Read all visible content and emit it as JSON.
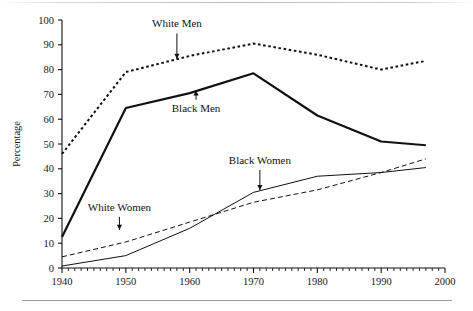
{
  "figure": {
    "background_color": "#ffffff",
    "axis_color": "#111114",
    "rule_color": "#9a9a9a"
  },
  "axes": {
    "ylabel": "Percentage",
    "xlabel": "",
    "y_ticks": [
      "0",
      "10",
      "20",
      "30",
      "40",
      "50",
      "60",
      "70",
      "80",
      "90",
      "100"
    ],
    "x_ticks": [
      "1940",
      "1950",
      "1960",
      "1970",
      "1980",
      "1990",
      "2000"
    ]
  },
  "annotations": [
    {
      "name": "white-men",
      "text": "White Men",
      "x": 1958,
      "label_y": 97,
      "arrow_dir": "down",
      "target_y": 84
    },
    {
      "name": "black-men",
      "text": "Black Men",
      "x": 1961,
      "label_y": 63,
      "arrow_dir": "up",
      "target_y": 72
    },
    {
      "name": "black-women",
      "text": "Black Women",
      "x": 1971,
      "label_y": 42,
      "arrow_dir": "down",
      "target_y": 31
    },
    {
      "name": "white-women",
      "text": "White Women",
      "x": 1949,
      "label_y": 23,
      "arrow_dir": "down",
      "target_y": 15
    }
  ],
  "chart_data": {
    "type": "line",
    "title": "",
    "xlabel": "",
    "ylabel": "Percentage",
    "xlim": [
      1940,
      2000
    ],
    "ylim": [
      0,
      100
    ],
    "grid": false,
    "legend_position": "inline-annotations",
    "x_tick_step": 10,
    "x_minor_tick_step": 1,
    "y_tick_step": 10,
    "series": [
      {
        "name": "White Men",
        "style": "dotted",
        "linewidth": 2.0,
        "color": "#111114",
        "x": [
          1940,
          1950,
          1960,
          1970,
          1980,
          1990,
          1997
        ],
        "values": [
          46,
          79,
          85.5,
          90.5,
          86,
          80,
          83.5
        ]
      },
      {
        "name": "Black Men",
        "style": "solid",
        "linewidth": 2.2,
        "color": "#111114",
        "x": [
          1940,
          1950,
          1960,
          1970,
          1980,
          1990,
          1997
        ],
        "values": [
          12.5,
          64.5,
          70.5,
          78.5,
          61.5,
          51,
          49.5
        ]
      },
      {
        "name": "White Women",
        "style": "dashed",
        "linewidth": 1.0,
        "color": "#111114",
        "x": [
          1940,
          1950,
          1960,
          1970,
          1980,
          1990,
          1997
        ],
        "values": [
          4.5,
          10.5,
          18.5,
          26.5,
          31.5,
          38.5,
          44
        ]
      },
      {
        "name": "Black Women",
        "style": "solid-thin",
        "linewidth": 1.0,
        "color": "#111114",
        "x": [
          1940,
          1950,
          1960,
          1970,
          1980,
          1990,
          1997
        ],
        "values": [
          0.8,
          5,
          16,
          30.5,
          37,
          38.5,
          40.5
        ]
      }
    ]
  }
}
